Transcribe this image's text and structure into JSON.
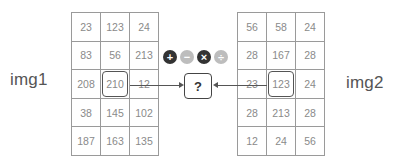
{
  "img1": {
    "label": "img1",
    "rows": [
      [
        "23",
        "123",
        "24"
      ],
      [
        "83",
        "56",
        "213"
      ],
      [
        "208",
        "210",
        "12"
      ],
      [
        "38",
        "145",
        "102"
      ],
      [
        "187",
        "163",
        "135"
      ]
    ],
    "highlight": {
      "row": 2,
      "col": 1
    }
  },
  "img2": {
    "label": "img2",
    "rows": [
      [
        "56",
        "58",
        "24"
      ],
      [
        "28",
        "167",
        "28"
      ],
      [
        "23",
        "123",
        "24"
      ],
      [
        "28",
        "213",
        "28"
      ],
      [
        "12",
        "24",
        "56"
      ]
    ],
    "highlight": {
      "row": 2,
      "col": 1
    }
  },
  "operators": [
    {
      "name": "add",
      "glyph": "+",
      "style": "dark"
    },
    {
      "name": "subtract",
      "glyph": "−",
      "style": "light"
    },
    {
      "name": "multiply",
      "glyph": "×",
      "style": "dark"
    },
    {
      "name": "divide",
      "glyph": "÷",
      "style": "light"
    }
  ],
  "result": {
    "text": "?"
  },
  "colors": {
    "border": "#9a9a9a",
    "text": "#8a8a8a",
    "highlight": "#555555",
    "op_dark": "#333333",
    "op_light": "#bdbdbd"
  }
}
